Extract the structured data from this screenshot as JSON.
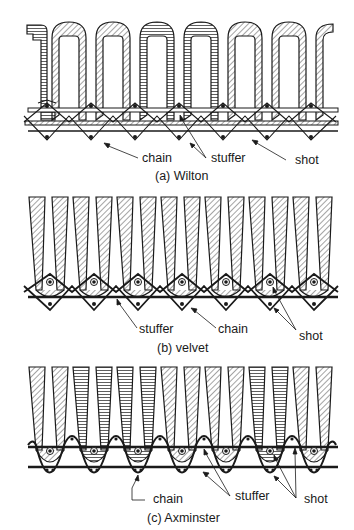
{
  "figure": {
    "panels": [
      {
        "id": "wilton",
        "caption": "(a) Wilton",
        "labels": {
          "chain": "chain",
          "stuffer": "stuffer",
          "shot": "shot"
        }
      },
      {
        "id": "velvet",
        "caption": "(b) velvet",
        "labels": {
          "stuffer": "stuffer",
          "chain": "chain",
          "shot": "shot"
        }
      },
      {
        "id": "axminster",
        "caption": "(c) Axminster",
        "labels": {
          "chain": "chain",
          "stuffer": "stuffer",
          "shot": "shot"
        }
      }
    ],
    "colors": {
      "ink": "#1a1a1a",
      "paper": "#ffffff"
    }
  }
}
